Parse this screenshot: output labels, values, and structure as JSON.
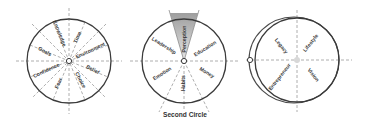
{
  "diagram": {
    "caption": "Second Circle",
    "circles": [
      {
        "name": "first-circle",
        "labels": [
          "Knowledge",
          "Time",
          "Goals",
          "Environment",
          "Confidence",
          "Belief",
          "Fear",
          "Choice"
        ]
      },
      {
        "name": "second-circle",
        "highlighted": "Perception",
        "labels": [
          "Leadership",
          "Perception",
          "Education",
          "Emotion",
          "Habits",
          "Money"
        ]
      },
      {
        "name": "third-circle",
        "labels": [
          "Legacy",
          "Lifestyle",
          "Entrepreneur",
          "Vision"
        ]
      }
    ],
    "colors": {
      "outline": "#3a3a3a",
      "dashes": "#9a9a9a",
      "wedge": "#bdbdbd"
    }
  }
}
